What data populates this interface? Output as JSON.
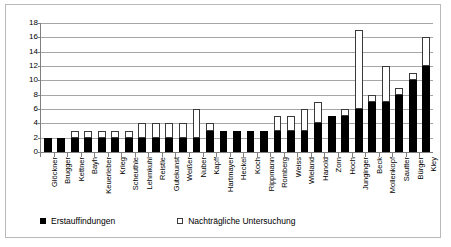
{
  "chart_data": {
    "type": "bar",
    "stacked": true,
    "title": "",
    "xlabel": "",
    "ylabel": "",
    "ylim": [
      0,
      18
    ],
    "yticks": [
      0,
      2,
      4,
      6,
      8,
      10,
      12,
      14,
      16,
      18
    ],
    "grid": true,
    "legend_position": "bottom-left",
    "categories": [
      "Glöckner",
      "Brugger",
      "Kettner",
      "Bayh",
      "Keuerleber",
      "Krieg",
      "Scheuthle",
      "Lehmkuhl",
      "Reistle",
      "Gutekunst",
      "Weißer",
      "Nuber",
      "Kapff",
      "Hartmayer",
      "Heckel",
      "Koch",
      "Rippmann",
      "Romberg",
      "Weiss",
      "Wieland",
      "Hanold",
      "Zorn",
      "Hoch",
      "Junginger",
      "Beck",
      "Mollenkopf",
      "Sautter",
      "Bürger",
      "Kley"
    ],
    "series": [
      {
        "name": "Erstauffindungen",
        "color": "#000000",
        "values": [
          2,
          2,
          2,
          2,
          2,
          2,
          2,
          2,
          2,
          2,
          2,
          2,
          3,
          3,
          3,
          3,
          3,
          3,
          3,
          3,
          4,
          5,
          5,
          6,
          7,
          7,
          8,
          10,
          12
        ]
      },
      {
        "name": "Nachträgliche Untersuchung",
        "color": "#ffffff",
        "values": [
          0,
          0,
          1,
          1,
          1,
          1,
          1,
          2,
          2,
          2,
          2,
          4,
          1,
          0,
          0,
          0,
          0,
          2,
          2,
          3,
          3,
          0,
          1,
          11,
          1,
          5,
          1,
          1,
          4
        ]
      }
    ],
    "totals": [
      2,
      2,
      3,
      3,
      3,
      3,
      3,
      4,
      4,
      4,
      4,
      6,
      4,
      3,
      3,
      3,
      3,
      5,
      5,
      6,
      7,
      5,
      6,
      17,
      8,
      12,
      9,
      11,
      16
    ]
  },
  "legend": {
    "items": [
      {
        "label": "Erstauffindungen",
        "swatch": "filled-square-icon"
      },
      {
        "label": "Nachträgliche Untersuchung",
        "swatch": "hollow-square-icon"
      }
    ]
  }
}
